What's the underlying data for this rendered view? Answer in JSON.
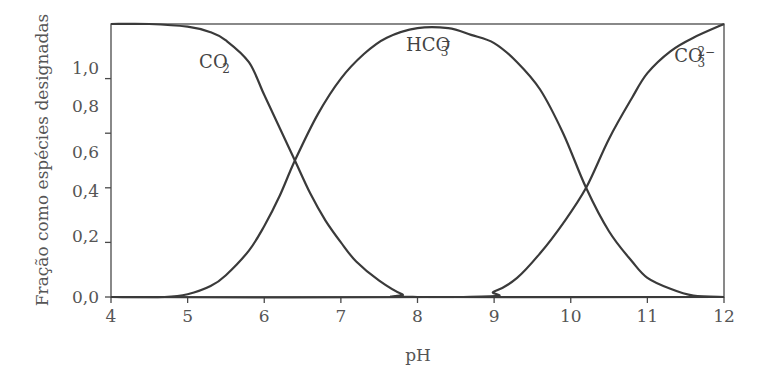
{
  "chart_data": {
    "type": "line",
    "title": "",
    "xlabel": "pH",
    "ylabel": "Fração como espécies designadas",
    "xlim": [
      4,
      12
    ],
    "ylim": [
      0,
      1.0
    ],
    "grid": false,
    "legend": "none (inline curve labels)",
    "x_ticks": [
      4,
      5,
      6,
      7,
      8,
      9,
      10,
      11,
      12
    ],
    "x_tick_labels": [
      "4",
      "5",
      "6",
      "7",
      "8",
      "9",
      "10",
      "11",
      "12"
    ],
    "y_ticks": [
      0.0,
      0.2,
      0.4,
      0.6,
      0.8,
      1.0
    ],
    "y_tick_labels": [
      "0,0",
      "0,2",
      "0,4",
      "0,6",
      "0,8",
      "1,0"
    ],
    "series": [
      {
        "name": "CO2",
        "label_main": "CO",
        "label_sub": "2",
        "label_sup": "",
        "label_pos": [
          5.15,
          0.84
        ],
        "x": [
          4.0,
          4.5,
          5.0,
          5.3,
          5.5,
          5.8,
          6.0,
          6.2,
          6.4,
          6.6,
          6.8,
          7.0,
          7.2,
          7.5,
          7.8,
          8.0,
          12.0
        ],
        "values": [
          1.0,
          1.0,
          0.99,
          0.97,
          0.94,
          0.86,
          0.74,
          0.62,
          0.5,
          0.38,
          0.28,
          0.2,
          0.13,
          0.06,
          0.01,
          0.0,
          0.0
        ]
      },
      {
        "name": "HCO3-",
        "label_main": "HCO",
        "label_sub": "3",
        "label_sup": "−",
        "label_pos": [
          7.85,
          0.9
        ],
        "x": [
          4.0,
          4.7,
          5.0,
          5.3,
          5.5,
          5.8,
          6.0,
          6.2,
          6.4,
          6.7,
          7.0,
          7.3,
          7.6,
          8.0,
          8.4,
          8.7,
          9.0,
          9.3,
          9.6,
          9.9,
          10.2,
          10.5,
          10.8,
          11.0,
          11.3,
          11.6,
          12.0
        ],
        "values": [
          0.0,
          0.0,
          0.01,
          0.04,
          0.08,
          0.17,
          0.26,
          0.37,
          0.5,
          0.67,
          0.8,
          0.89,
          0.95,
          0.985,
          0.985,
          0.96,
          0.93,
          0.86,
          0.76,
          0.6,
          0.4,
          0.24,
          0.13,
          0.07,
          0.03,
          0.005,
          0.0
        ]
      },
      {
        "name": "CO3 2-",
        "label_main": "CO",
        "label_sub": "3",
        "label_sup": "2−",
        "label_pos": [
          11.35,
          0.86
        ],
        "x": [
          4.0,
          8.6,
          9.0,
          9.3,
          9.6,
          9.9,
          10.2,
          10.5,
          10.8,
          11.0,
          11.3,
          11.6,
          12.0
        ],
        "values": [
          0.0,
          0.0,
          0.02,
          0.07,
          0.16,
          0.27,
          0.4,
          0.58,
          0.73,
          0.82,
          0.9,
          0.95,
          1.0
        ]
      }
    ]
  },
  "style": {
    "line_color": "#3a3a3a",
    "axis_color": "#4a4a4a",
    "text_color": "#555555"
  }
}
